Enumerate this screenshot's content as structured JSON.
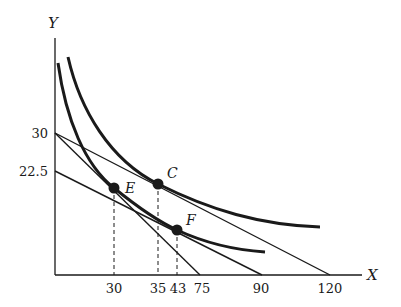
{
  "diagram": {
    "type": "indifference-curve-budget-line",
    "axes": {
      "x_label": "X",
      "y_label": "Y"
    },
    "y_ticks": [
      {
        "label": "30",
        "value": 30
      },
      {
        "label": "22.5",
        "value": 22.5
      }
    ],
    "x_ticks": [
      {
        "label": "30",
        "value": 30
      },
      {
        "label": "35",
        "value": 35
      },
      {
        "label": "43",
        "value": 43
      },
      {
        "label": "75",
        "value": 75
      },
      {
        "label": "90",
        "value": 90
      },
      {
        "label": "120",
        "value": 120
      }
    ],
    "budget_lines": [
      {
        "name": "budget-line-1",
        "y_intercept": 30,
        "x_intercept": 75
      },
      {
        "name": "budget-line-2",
        "y_intercept": 30,
        "x_intercept": 120
      },
      {
        "name": "budget-line-3",
        "y_intercept": 22.5,
        "x_intercept": 90
      }
    ],
    "indifference_curves": [
      {
        "name": "indifference-curve-lower",
        "passes_through": [
          "E",
          "F"
        ]
      },
      {
        "name": "indifference-curve-upper",
        "passes_through": [
          "C"
        ]
      }
    ],
    "points": [
      {
        "label": "E",
        "x_value": 30
      },
      {
        "label": "C",
        "x_value": 35
      },
      {
        "label": "F",
        "x_value": 43
      }
    ],
    "colors": {
      "ink": "#1a1a1a",
      "background": "#ffffff"
    }
  }
}
